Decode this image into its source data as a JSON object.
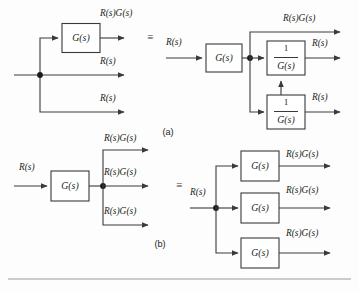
{
  "figure": {
    "type": "control-system-block-diagram",
    "signal_labels": {
      "input": "R(s)",
      "output_through_block": "R(s)G(s)",
      "plain": "R(s)"
    },
    "block_labels": {
      "forward": "G(s)",
      "inverse_numerator": "1",
      "inverse_denominator": "G(s)"
    },
    "equivalence_symbol": "≡",
    "part_labels": {
      "a": "(a)",
      "b": "(b)"
    }
  },
  "diagram_a": {
    "caption": "(a)",
    "equivalence_symbol": "≡",
    "left": {
      "input_label": "",
      "blocks": [
        {
          "name": "G-block",
          "label": "G(s)"
        }
      ],
      "outputs": [
        {
          "label": "R(s)G(s)"
        },
        {
          "label": "R(s)"
        },
        {
          "label": "R(s)"
        }
      ]
    },
    "right": {
      "input_label": "R(s)",
      "blocks": [
        {
          "name": "G-block",
          "label": "G(s)"
        },
        {
          "name": "inv-G-block-upper",
          "numerator": "1",
          "denominator": "G(s)"
        },
        {
          "name": "inv-G-block-lower",
          "numerator": "1",
          "denominator": "G(s)"
        }
      ],
      "outputs": [
        {
          "label": "R(s)G(s)"
        },
        {
          "label": "R(s)"
        },
        {
          "label": "R(s)"
        }
      ]
    }
  },
  "diagram_b": {
    "caption": "(b)",
    "equivalence_symbol": "≡",
    "left": {
      "input_label": "R(s)",
      "blocks": [
        {
          "name": "G-block",
          "label": "G(s)"
        }
      ],
      "outputs": [
        {
          "label": "R(s)G(s)"
        },
        {
          "label": "R(s)G(s)"
        },
        {
          "label": "R(s)G(s)"
        }
      ]
    },
    "right": {
      "input_label": "R(s)",
      "blocks": [
        {
          "name": "G-block-top",
          "label": "G(s)"
        },
        {
          "name": "G-block-middle",
          "label": "G(s)"
        },
        {
          "name": "G-block-bottom",
          "label": "G(s)"
        }
      ],
      "outputs": [
        {
          "label": "R(s)G(s)"
        },
        {
          "label": "R(s)G(s)"
        },
        {
          "label": "R(s)G(s)"
        }
      ]
    }
  },
  "colors": {
    "line": "#3a3a3a",
    "text": "#231f20",
    "background": "#fdfdfd",
    "rule": "#9a9a9a"
  }
}
